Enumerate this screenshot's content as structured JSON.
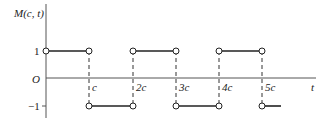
{
  "diagram": {
    "y_axis_label": "M(c, t)",
    "x_axis_label": "t",
    "origin_label": "O",
    "y_ticks": [
      {
        "label": "1",
        "value": 1
      },
      {
        "label": "−1",
        "value": -1
      }
    ],
    "x_ticks": [
      {
        "label": "c"
      },
      {
        "label": "2c"
      },
      {
        "label": "3c"
      },
      {
        "label": "4c"
      },
      {
        "label": "5c"
      }
    ],
    "segments": [
      {
        "from": "0",
        "to": "c",
        "value": 1
      },
      {
        "from": "c",
        "to": "2c",
        "value": -1
      },
      {
        "from": "2c",
        "to": "3c",
        "value": 1
      },
      {
        "from": "3c",
        "to": "4c",
        "value": -1
      },
      {
        "from": "4c",
        "to": "5c",
        "value": 1
      },
      {
        "from": "5c",
        "to": "...",
        "value": -1
      }
    ],
    "colors": {
      "line": "#222222",
      "axis": "#555555",
      "background": "#ffffff"
    }
  }
}
